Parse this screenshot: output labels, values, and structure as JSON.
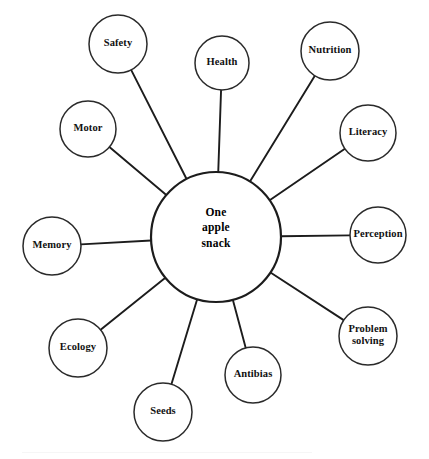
{
  "diagram": {
    "type": "web-diagram",
    "hub": {
      "label_lines": [
        "One",
        "apple",
        "snack"
      ],
      "line1": "One",
      "line2": "apple",
      "line3": "snack",
      "cx": 216,
      "cy": 237,
      "r": 65
    },
    "canvas": {
      "width": 429,
      "height": 459,
      "background": "#ffffff"
    },
    "colors": {
      "stroke": "#2a2a2a",
      "hub_stroke": "#1c1c1c",
      "spoke": "#1c1c1c",
      "fill": "#ffffff",
      "text": "#111111"
    },
    "nodes": [
      {
        "id": "safety",
        "label": "Safety",
        "cx": 118,
        "cy": 44,
        "r": 29,
        "lines": [
          "Safety"
        ]
      },
      {
        "id": "health",
        "label": "Health",
        "cx": 222,
        "cy": 63,
        "r": 27,
        "lines": [
          "Health"
        ]
      },
      {
        "id": "nutrition",
        "label": "Nutrition",
        "cx": 330,
        "cy": 51,
        "r": 29,
        "lines": [
          "Nutrition"
        ]
      },
      {
        "id": "literacy",
        "label": "Literacy",
        "cx": 368,
        "cy": 133,
        "r": 28,
        "lines": [
          "Literacy"
        ]
      },
      {
        "id": "perception",
        "label": "Perception",
        "cx": 378,
        "cy": 235,
        "r": 28,
        "lines": [
          "Perception"
        ]
      },
      {
        "id": "problem-solving",
        "label": "Problem solving",
        "cx": 368,
        "cy": 336,
        "r": 29,
        "lines": [
          "Problem",
          "solving"
        ]
      },
      {
        "id": "antibias",
        "label": "Antibias",
        "cx": 253,
        "cy": 375,
        "r": 28,
        "lines": [
          "Antibias"
        ]
      },
      {
        "id": "seeds",
        "label": "Seeds",
        "cx": 163,
        "cy": 412,
        "r": 29,
        "lines": [
          "Seeds"
        ]
      },
      {
        "id": "ecology",
        "label": "Ecology",
        "cx": 78,
        "cy": 348,
        "r": 29,
        "lines": [
          "Ecology"
        ]
      },
      {
        "id": "memory",
        "label": "Memory",
        "cx": 52,
        "cy": 246,
        "r": 29,
        "lines": [
          "Memory"
        ]
      },
      {
        "id": "motor",
        "label": "Motor",
        "cx": 88,
        "cy": 129,
        "r": 28,
        "lines": [
          "Motor"
        ]
      }
    ]
  }
}
